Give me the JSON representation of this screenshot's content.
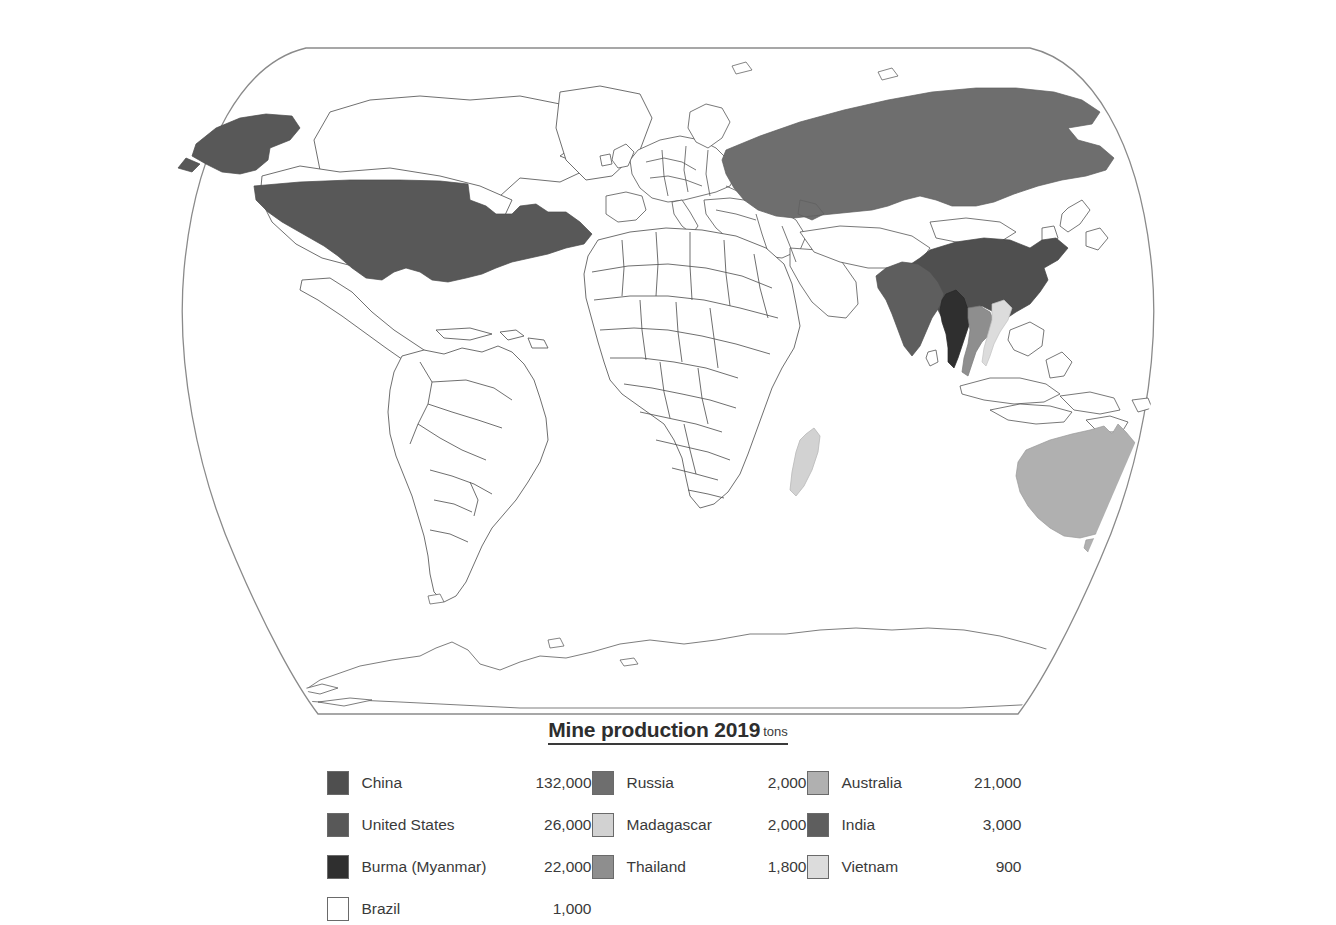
{
  "legend": {
    "title": "Mine production 2019",
    "units": "tons",
    "columns": [
      {
        "id": "column-1",
        "entries": [
          {
            "country": "China",
            "value": "132,000",
            "color": "#4f4f4f"
          },
          {
            "country": "United States",
            "value": "26,000",
            "color": "#585858"
          },
          {
            "country": "Burma (Myanmar)",
            "value": "22,000",
            "color": "#2f2f2f"
          },
          {
            "country": "Brazil",
            "value": "1,000",
            "color": "#ffffff"
          }
        ]
      },
      {
        "id": "column-2",
        "entries": [
          {
            "country": "Russia",
            "value": "2,000",
            "color": "#6e6e6e"
          },
          {
            "country": "Madagascar",
            "value": "2,000",
            "color": "#d2d2d2"
          },
          {
            "country": "Thailand",
            "value": "1,800",
            "color": "#8e8e8e"
          }
        ]
      },
      {
        "id": "column-3",
        "entries": [
          {
            "country": "Australia",
            "value": "21,000",
            "color": "#b0b0b0"
          },
          {
            "country": "India",
            "value": "3,000",
            "color": "#5e5e5e"
          },
          {
            "country": "Vietnam",
            "value": "900",
            "color": "#dcdcdc"
          }
        ]
      }
    ]
  },
  "map": {
    "projection": "robinson-world-outline",
    "ocean_color": "#ffffff",
    "border_color": "#555555",
    "frame_color": "#777777",
    "highlighted": [
      {
        "country": "China",
        "color": "#4f4f4f"
      },
      {
        "country": "United States",
        "color": "#585858"
      },
      {
        "country": "Alaska",
        "color": "#585858"
      },
      {
        "country": "Burma (Myanmar)",
        "color": "#2f2f2f"
      },
      {
        "country": "Brazil",
        "color": "#ffffff"
      },
      {
        "country": "Russia",
        "color": "#6e6e6e"
      },
      {
        "country": "Madagascar",
        "color": "#d2d2d2"
      },
      {
        "country": "Thailand",
        "color": "#8e8e8e"
      },
      {
        "country": "Australia",
        "color": "#b0b0b0"
      },
      {
        "country": "India",
        "color": "#5e5e5e"
      },
      {
        "country": "Vietnam",
        "color": "#dcdcdc"
      }
    ]
  },
  "footer": {
    "ghost_text": ""
  }
}
